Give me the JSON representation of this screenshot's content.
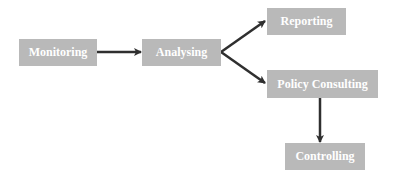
{
  "diagram": {
    "type": "flowchart",
    "colors": {
      "box_fill": "#b9b9b9",
      "box_text": "#ffffff",
      "arrow": "#2f2f2f"
    },
    "nodes": [
      {
        "id": "monitoring",
        "label": "Monitoring"
      },
      {
        "id": "analysing",
        "label": "Analysing"
      },
      {
        "id": "reporting",
        "label": "Reporting"
      },
      {
        "id": "policy",
        "label": "Policy Consulting"
      },
      {
        "id": "controlling",
        "label": "Controlling"
      }
    ],
    "edges": [
      {
        "from": "Monitoring",
        "to": "Analysing"
      },
      {
        "from": "Analysing",
        "to": "Reporting"
      },
      {
        "from": "Analysing",
        "to": "Policy Consulting"
      },
      {
        "from": "Policy Consulting",
        "to": "Controlling"
      }
    ]
  }
}
